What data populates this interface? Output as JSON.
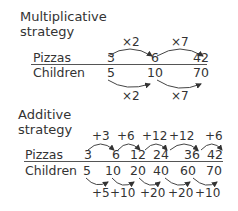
{
  "multiplicative": {
    "title_line1": "Multiplicative",
    "title_line2": "strategy",
    "row_labels": {
      "top": "Pizzas",
      "bottom": "Children"
    },
    "pizzas": [
      "3",
      "6",
      "42"
    ],
    "children": [
      "5",
      "10",
      "70"
    ],
    "top_ops": [
      "×2",
      "×7"
    ],
    "bottom_ops": [
      "×2",
      "×7"
    ]
  },
  "additive": {
    "title_line1": "Additive",
    "title_line2": "strategy",
    "row_labels": {
      "top": "Pizzas",
      "bottom": "Children"
    },
    "pizzas": [
      "3",
      "6",
      "12",
      "24",
      "36",
      "42"
    ],
    "children": [
      "5",
      "10",
      "20",
      "40",
      "60",
      "70"
    ],
    "top_ops": [
      "+3",
      "+6",
      "+12",
      "+12",
      "+6"
    ],
    "bottom_ops": [
      "+5",
      "+10",
      "+20",
      "+20",
      "+10"
    ]
  },
  "colors": {
    "text": "#333333",
    "line": "#555555",
    "background": "#ffffff"
  }
}
